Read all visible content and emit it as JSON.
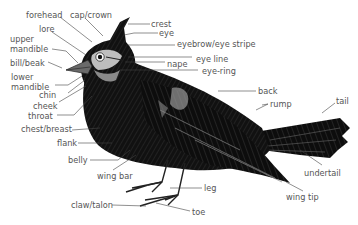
{
  "diagram": {
    "label_color": "#555555",
    "line_color": "#444444",
    "labels": {
      "forehead": "forehead",
      "cap_crown": "cap/crown",
      "crest": "crest",
      "eye": "eye",
      "lore": "lore",
      "upper_mandible_1": "upper",
      "upper_mandible_2": "mandible",
      "eyebrow": "eyebrow/eye stripe",
      "bill_beak": "bill/beak",
      "eye_line": "eye line",
      "nape": "nape",
      "eye_ring": "eye-ring",
      "lower_mandible_1": "lower",
      "lower_mandible_2": "mandible",
      "chin": "chin",
      "cheek": "cheek",
      "throat": "throat",
      "back": "back",
      "rump": "rump",
      "tail": "tail",
      "chest_breast": "chest/breast",
      "flank": "flank",
      "belly": "belly",
      "wing_bar": "wing bar",
      "undertail": "undertail",
      "leg": "leg",
      "claw_talon": "claw/talon",
      "wing_tip": "wing tip",
      "toe": "toe"
    }
  }
}
